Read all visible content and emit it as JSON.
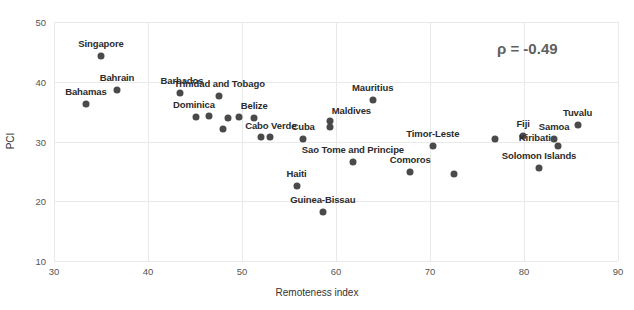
{
  "chart_data": {
    "type": "scatter",
    "title": "",
    "xlabel": "Remoteness index",
    "ylabel": "PCI",
    "xlim": [
      30,
      90
    ],
    "ylim": [
      10,
      50
    ],
    "xticks": [
      30,
      40,
      50,
      60,
      70,
      80,
      90
    ],
    "yticks": [
      10,
      20,
      30,
      40,
      50
    ],
    "grid": true,
    "legend": null,
    "annotations": [
      {
        "name": "correlation",
        "text": "ρ = -0.49"
      }
    ],
    "marker_color": "#4a4a4a",
    "grid_color": "#e9e9e9",
    "points": [
      {
        "label": "Singapore",
        "x": 35.0,
        "y": 44.3,
        "label_dx": 0,
        "label_dy": -7
      },
      {
        "label": "Bahrain",
        "x": 36.7,
        "y": 38.6,
        "label_dx": 0,
        "label_dy": -7
      },
      {
        "label": "Bahamas",
        "x": 33.4,
        "y": 36.3,
        "label_dx": 0,
        "label_dy": -7
      },
      {
        "label": "Barbados",
        "x": 43.4,
        "y": 38.2,
        "label_dx": 2,
        "label_dy": -7
      },
      {
        "label": "Trinidad and Tobago",
        "x": 47.6,
        "y": 37.6,
        "label_dx": 0,
        "label_dy": -7
      },
      {
        "label": "Dominica",
        "x": 45.1,
        "y": 34.1,
        "label_dx": -2,
        "label_dy": -7
      },
      {
        "label": "",
        "x": 46.5,
        "y": 34.2,
        "label_dx": 0,
        "label_dy": 0
      },
      {
        "label": "",
        "x": 48.5,
        "y": 33.9,
        "label_dx": 0,
        "label_dy": 0
      },
      {
        "label": "",
        "x": 49.7,
        "y": 34.1,
        "label_dx": 0,
        "label_dy": 0
      },
      {
        "label": "Belize",
        "x": 51.3,
        "y": 33.9,
        "label_dx": 0,
        "label_dy": -7
      },
      {
        "label": "",
        "x": 48.0,
        "y": 32.1,
        "label_dx": 0,
        "label_dy": 0
      },
      {
        "label": "Cabo Verde",
        "x": 52.0,
        "y": 30.7,
        "label_dx": 10,
        "label_dy": -6
      },
      {
        "label": "",
        "x": 53.0,
        "y": 30.7,
        "label_dx": 0,
        "label_dy": 0
      },
      {
        "label": "Cuba",
        "x": 56.5,
        "y": 30.5,
        "label_dx": 0,
        "label_dy": -7
      },
      {
        "label": "Maldives",
        "x": 59.4,
        "y": 33.4,
        "label_dx": 21,
        "label_dy": -5
      },
      {
        "label": "",
        "x": 59.4,
        "y": 32.4,
        "label_dx": 0,
        "label_dy": 0
      },
      {
        "label": "Mauritius",
        "x": 63.9,
        "y": 36.9,
        "label_dx": 0,
        "label_dy": -7
      },
      {
        "label": "Sao Tome and Principe",
        "x": 61.8,
        "y": 26.6,
        "label_dx": 0,
        "label_dy": -7
      },
      {
        "label": "Haiti",
        "x": 55.8,
        "y": 22.6,
        "label_dx": 0,
        "label_dy": -7
      },
      {
        "label": "Guinea-Bissau",
        "x": 58.6,
        "y": 18.2,
        "label_dx": 0,
        "label_dy": -7
      },
      {
        "label": "Comoros",
        "x": 67.9,
        "y": 24.9,
        "label_dx": 0,
        "label_dy": -7
      },
      {
        "label": "Timor-Leste",
        "x": 70.3,
        "y": 29.2,
        "label_dx": 0,
        "label_dy": -7
      },
      {
        "label": "",
        "x": 72.5,
        "y": 24.5,
        "label_dx": 0,
        "label_dy": 0
      },
      {
        "label": "",
        "x": 76.9,
        "y": 30.5,
        "label_dx": 0,
        "label_dy": 0
      },
      {
        "label": "Fiji",
        "x": 79.9,
        "y": 30.9,
        "label_dx": 0,
        "label_dy": -7
      },
      {
        "label": "Samoa",
        "x": 83.2,
        "y": 30.4,
        "label_dx": 0,
        "label_dy": -7
      },
      {
        "label": "Tuvalu",
        "x": 85.7,
        "y": 32.8,
        "label_dx": 0,
        "label_dy": -7
      },
      {
        "label": "Kiribati",
        "x": 83.6,
        "y": 29.2,
        "label_dx": -23,
        "label_dy": -3
      },
      {
        "label": "Solomon Islands",
        "x": 81.6,
        "y": 25.5,
        "label_dx": 0,
        "label_dy": -7
      }
    ]
  }
}
